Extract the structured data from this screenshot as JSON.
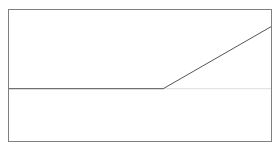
{
  "chart_data": {
    "type": "line",
    "title": "",
    "xlabel": "",
    "ylabel": "",
    "grid": false,
    "legend": null,
    "xlim": [
      0,
      1
    ],
    "ylim": [
      0,
      1
    ],
    "series": [
      {
        "name": "line",
        "x": [
          0.0,
          0.59,
          1.0
        ],
        "y": [
          0.4,
          0.4,
          0.87
        ]
      }
    ],
    "reference_lines": [
      {
        "orientation": "horizontal",
        "y": 0.4,
        "style": "faint"
      }
    ]
  },
  "colors": {
    "frame": "#7f7f7f",
    "line": "#555555",
    "reference": "#dddddd",
    "background": "#ffffff"
  },
  "plot_box": {
    "left": 8,
    "top": 9,
    "right": 271,
    "bottom": 141
  }
}
